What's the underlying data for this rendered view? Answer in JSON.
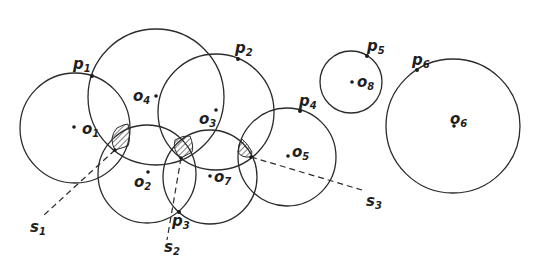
{
  "diagram": {
    "circles": [
      {
        "id": "o1",
        "label": "o",
        "sub": "1",
        "cx": 75,
        "cy": 128,
        "r": 55,
        "dot": [
          74,
          127
        ],
        "label_pos": [
          82,
          134
        ]
      },
      {
        "id": "o2",
        "label": "o",
        "sub": "2",
        "cx": 147,
        "cy": 174,
        "r": 49,
        "dot": [
          148,
          172
        ],
        "label_pos": [
          134,
          187
        ]
      },
      {
        "id": "o3",
        "label": "o",
        "sub": "3",
        "cx": 216,
        "cy": 112,
        "r": 58,
        "dot": [
          216,
          110
        ],
        "label_pos": [
          199,
          124
        ]
      },
      {
        "id": "o4",
        "label": "o",
        "sub": "4",
        "cx": 156,
        "cy": 97,
        "r": 68,
        "dot": [
          156,
          96
        ],
        "label_pos": [
          133,
          101
        ]
      },
      {
        "id": "o5",
        "label": "o",
        "sub": "5",
        "cx": 287,
        "cy": 157,
        "r": 49,
        "dot": [
          288,
          156
        ],
        "label_pos": [
          292,
          157
        ]
      },
      {
        "id": "o6",
        "label": "o",
        "sub": "6",
        "cx": 453,
        "cy": 126,
        "r": 67,
        "dot": [
          454,
          126
        ],
        "label_pos": [
          450,
          124
        ]
      },
      {
        "id": "o7",
        "label": "o",
        "sub": "7",
        "cx": 210,
        "cy": 177,
        "r": 47,
        "dot": [
          210,
          176
        ],
        "label_pos": [
          214,
          182
        ]
      },
      {
        "id": "o8",
        "label": "o",
        "sub": "8",
        "cx": 351,
        "cy": 82,
        "r": 31,
        "dot": [
          352,
          82
        ],
        "label_pos": [
          357,
          87
        ]
      }
    ],
    "points": [
      {
        "id": "p1",
        "label": "p",
        "sub": "1",
        "x": 92,
        "y": 76,
        "label_pos": [
          73,
          69
        ]
      },
      {
        "id": "p2",
        "label": "p",
        "sub": "2",
        "x": 238,
        "y": 59,
        "label_pos": [
          235,
          53
        ]
      },
      {
        "id": "p3",
        "label": "p",
        "sub": "3",
        "x": 179,
        "y": 212,
        "label_pos": [
          172,
          226
        ]
      },
      {
        "id": "p4",
        "label": "p",
        "sub": "4",
        "x": 300,
        "y": 111,
        "label_pos": [
          299,
          106
        ]
      },
      {
        "id": "p5",
        "label": "p",
        "sub": "5",
        "x": 367,
        "y": 56,
        "label_pos": [
          367,
          51
        ]
      },
      {
        "id": "p6",
        "label": "p",
        "sub": "6",
        "x": 417,
        "y": 70,
        "label_pos": [
          412,
          65
        ]
      }
    ],
    "segments": [
      {
        "id": "s1",
        "label": "s",
        "sub": "1",
        "x1": 115,
        "y1": 150,
        "x2": 44,
        "y2": 215,
        "label_pos": [
          30,
          232
        ]
      },
      {
        "id": "s2",
        "label": "s",
        "sub": "2",
        "x1": 181,
        "y1": 158,
        "x2": 167,
        "y2": 240,
        "label_pos": [
          164,
          252
        ]
      },
      {
        "id": "s3",
        "label": "s",
        "sub": "3",
        "x1": 251,
        "y1": 157,
        "x2": 362,
        "y2": 190,
        "label_pos": [
          366,
          206
        ]
      }
    ],
    "hatched_regions": [
      {
        "id": "h1",
        "path": "M115,150 Q108,138 117,128 Q124,124 128,124 Q131,138 128,146 Z"
      },
      {
        "id": "h2",
        "path": "M181,158 Q172,150 175,140 Q183,135 190,136 Q194,146 192,152 Z"
      },
      {
        "id": "h3",
        "path": "M251,157 Q241,158 238,152 Q238,144 242,139 Q248,144 252,152 Z"
      }
    ]
  }
}
